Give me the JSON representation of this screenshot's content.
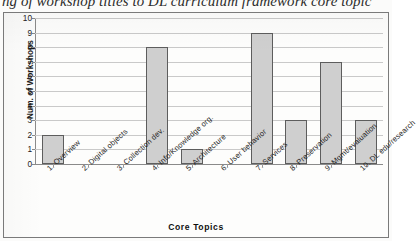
{
  "caption": "ng of workshop titles to DL curriculum framework core topic",
  "chart_data": {
    "type": "bar",
    "title": "ng of workshop titles to DL curriculum framework core topic",
    "xlabel": "Core Topics",
    "ylabel": "Num. of Workshops",
    "categories": [
      "1. Overview",
      "2. Digital objects",
      "3. Collection dev.",
      "4. Info/Knowledge org.",
      "5. Architecture",
      "6. User behavior",
      "7. Services",
      "8. Preservation",
      "9. Mgmt/evaluation",
      "10. DL edu/research"
    ],
    "values": [
      2,
      0,
      0,
      8,
      1,
      0,
      9,
      3,
      7,
      3
    ],
    "ylim": [
      0,
      10
    ],
    "ytick_labels": [
      "0",
      "1",
      "2",
      "3",
      "4",
      "5",
      "6",
      "7",
      "8",
      "9",
      "10"
    ],
    "ytick_values": [
      0,
      1,
      2,
      3,
      4,
      5,
      6,
      7,
      8,
      9,
      10
    ],
    "grid": true,
    "legend": false,
    "bar_fill_color": "#cfcfcf",
    "bar_border_color": "#5d5d5d",
    "gridline_color": "#c9c9c9",
    "axis_color": "#8a8a8a"
  }
}
